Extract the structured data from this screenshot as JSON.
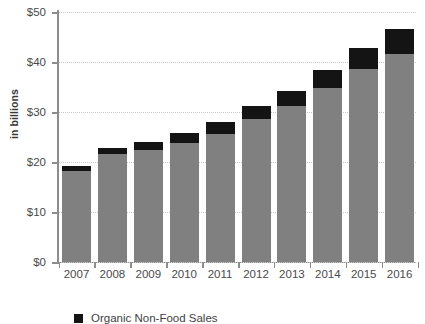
{
  "chart_data": {
    "type": "bar",
    "stacked": true,
    "title": "",
    "subtitle": "",
    "xlabel": "",
    "ylabel": "in billions",
    "categories": [
      "2007",
      "2008",
      "2009",
      "2010",
      "2011",
      "2012",
      "2013",
      "2014",
      "2015",
      "2016"
    ],
    "series": [
      {
        "name": "Organic Food Sales",
        "color": "#808080",
        "values": [
          18.2,
          21.6,
          22.4,
          23.8,
          25.7,
          28.6,
          31.2,
          34.8,
          38.6,
          41.6
        ]
      },
      {
        "name": "Organic Non-Food Sales",
        "color": "#141414",
        "values": [
          1.0,
          1.2,
          1.6,
          2.1,
          2.4,
          2.6,
          3.0,
          3.6,
          4.2,
          5.0
        ]
      }
    ],
    "totals": [
      19.2,
      22.8,
      24.0,
      25.9,
      28.1,
      31.2,
      34.2,
      38.4,
      42.8,
      46.6
    ],
    "ylim": [
      0,
      50
    ],
    "yticks": [
      0,
      10,
      20,
      30,
      40,
      50
    ],
    "ytick_labels": [
      "$0",
      "$10",
      "$20",
      "$30",
      "$40",
      "$50"
    ],
    "grid": true,
    "grid_axis": "y",
    "legend_position": "bottom-left"
  },
  "legend": {
    "entries": [
      {
        "label": "Organic Non-Food Sales",
        "color": "#141414"
      }
    ]
  },
  "axes": {
    "y_title": "in billions"
  },
  "colors": {
    "food": "#808080",
    "non_food": "#141414",
    "axis": "#8d8d8d",
    "grid": "#c9c9c9",
    "text": "#4a4a4a",
    "background": "#ffffff"
  }
}
